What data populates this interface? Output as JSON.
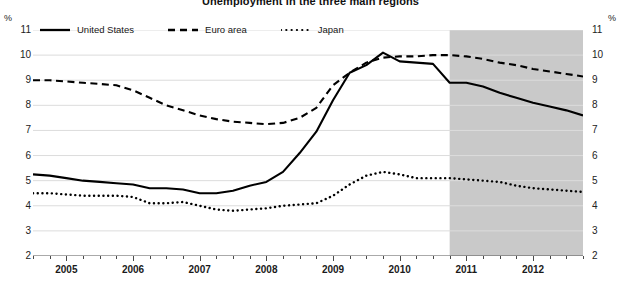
{
  "chart_data": {
    "type": "line",
    "title": "Unemployment in the three main regions",
    "xlabel": "",
    "ylabel": "%",
    "ylabel_right": "%",
    "ylim": [
      2,
      11
    ],
    "yticks": [
      11,
      10,
      9,
      8,
      7,
      6,
      5,
      4,
      3,
      2
    ],
    "xlim": [
      2004.5,
      2012.75
    ],
    "xticks": [
      "2005",
      "2006",
      "2007",
      "2008",
      "2009",
      "2010",
      "2011",
      "2012"
    ],
    "xtick_positions": [
      2005,
      2006,
      2007,
      2008,
      2009,
      2010,
      2011,
      2012
    ],
    "grid": true,
    "grid_axis": "y",
    "legend_position": "top-left",
    "minor_tick_interval_years": 0.25,
    "shaded_region": {
      "label": "forecast",
      "x_start": 2010.75,
      "x_end": 2012.75,
      "color": "#c9c9c9"
    },
    "x": [
      2004.5,
      2004.75,
      2005.0,
      2005.25,
      2005.5,
      2005.75,
      2006.0,
      2006.25,
      2006.5,
      2006.75,
      2007.0,
      2007.25,
      2007.5,
      2007.75,
      2008.0,
      2008.25,
      2008.5,
      2008.75,
      2009.0,
      2009.25,
      2009.5,
      2009.75,
      2010.0,
      2010.25,
      2010.5,
      2010.75,
      2011.0,
      2011.25,
      2011.5,
      2011.75,
      2012.0,
      2012.25,
      2012.5,
      2012.75
    ],
    "series": [
      {
        "name": "United States",
        "style": "solid",
        "color": "#000000",
        "values": [
          5.25,
          5.2,
          5.1,
          5.0,
          4.95,
          4.9,
          4.85,
          4.7,
          4.7,
          4.65,
          4.5,
          4.5,
          4.6,
          4.8,
          4.95,
          5.35,
          6.1,
          6.95,
          8.2,
          9.3,
          9.6,
          10.1,
          9.75,
          9.7,
          9.65,
          8.9,
          8.9,
          8.75,
          8.5,
          8.3,
          8.1,
          7.95,
          7.8,
          7.6
        ]
      },
      {
        "name": "Euro area",
        "style": "dashed",
        "color": "#000000",
        "values": [
          9.0,
          9.0,
          8.95,
          8.9,
          8.85,
          8.8,
          8.6,
          8.3,
          8.0,
          7.8,
          7.6,
          7.45,
          7.35,
          7.3,
          7.25,
          7.3,
          7.5,
          7.9,
          8.8,
          9.3,
          9.7,
          9.9,
          9.95,
          9.95,
          10.0,
          10.0,
          9.95,
          9.85,
          9.7,
          9.6,
          9.45,
          9.35,
          9.25,
          9.15
        ]
      },
      {
        "name": "Japan",
        "style": "dotted",
        "color": "#000000",
        "values": [
          4.5,
          4.5,
          4.45,
          4.4,
          4.4,
          4.4,
          4.35,
          4.1,
          4.1,
          4.15,
          4.0,
          3.85,
          3.8,
          3.85,
          3.9,
          4.0,
          4.05,
          4.1,
          4.4,
          4.85,
          5.2,
          5.35,
          5.25,
          5.1,
          5.1,
          5.1,
          5.05,
          5.0,
          4.95,
          4.8,
          4.7,
          4.65,
          4.6,
          4.55
        ]
      }
    ]
  },
  "legend": {
    "items": [
      {
        "label": "United States",
        "style": "solid"
      },
      {
        "label": "Euro area",
        "style": "dashed"
      },
      {
        "label": "Japan",
        "style": "dotted"
      }
    ]
  }
}
